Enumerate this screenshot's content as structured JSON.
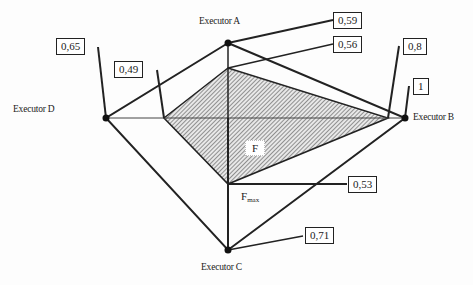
{
  "diagram": {
    "center": [
      228,
      118
    ],
    "executors": [
      {
        "id": "A",
        "label": "Executor A",
        "point": [
          228,
          43
        ],
        "value": "0,59"
      },
      {
        "id": "B",
        "label": "Executor B",
        "point": [
          405,
          118
        ],
        "value": "1"
      },
      {
        "id": "C",
        "label": "Executor C",
        "point": [
          228,
          250
        ],
        "value": "0,71"
      },
      {
        "id": "D",
        "label": "Executor D",
        "point": [
          106,
          118
        ],
        "value": "0,65"
      }
    ],
    "inner_values": [
      {
        "axis": "A",
        "value": "0,56"
      },
      {
        "axis": "B",
        "value": "0,8"
      },
      {
        "axis": "C",
        "value": "0,53"
      },
      {
        "axis": "D",
        "value": "0,49"
      }
    ],
    "region_label": "F",
    "max_label": "F",
    "max_label_sub": "max",
    "colors": {
      "line": "#222222",
      "hatch": "#555555",
      "background": "#fdfdfd"
    }
  }
}
